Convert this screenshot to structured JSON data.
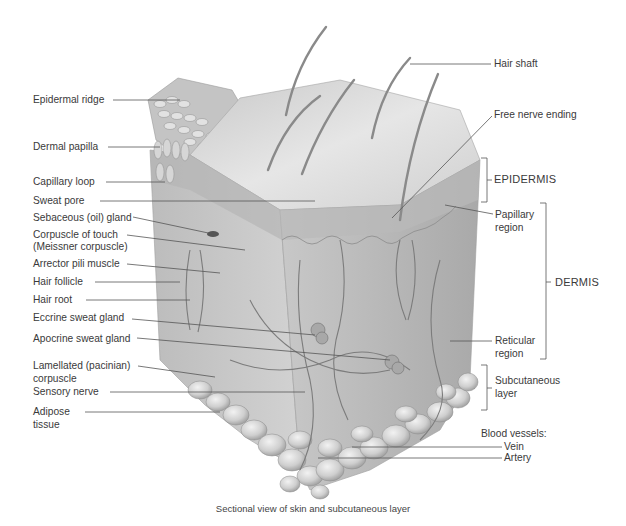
{
  "figure": {
    "caption": "Sectional view of skin and subcutaneous layer",
    "colors": {
      "background": "#ffffff",
      "tissue_light": "#dcdcdc",
      "tissue_mid": "#bdbdbd",
      "tissue_dark": "#8f8f8f",
      "leader_line": "#555555",
      "label_text": "#3a3a3a"
    }
  },
  "labels": {
    "left": [
      {
        "id": "epidermal_ridge",
        "text": "Epidermal ridge"
      },
      {
        "id": "dermal_papilla",
        "text": "Dermal papilla"
      },
      {
        "id": "capillary_loop",
        "text": "Capillary loop"
      },
      {
        "id": "sweat_pore",
        "text": "Sweat pore"
      },
      {
        "id": "sebaceous_gland",
        "text": "Sebaceous (oil) gland"
      },
      {
        "id": "corpuscle_of_touch",
        "text": "Corpuscle of touch",
        "text2": "(Meissner corpuscle)"
      },
      {
        "id": "arrector_pili",
        "text": "Arrector pili muscle"
      },
      {
        "id": "hair_follicle",
        "text": "Hair follicle"
      },
      {
        "id": "hair_root",
        "text": "Hair root"
      },
      {
        "id": "eccrine_gland",
        "text": "Eccrine sweat gland"
      },
      {
        "id": "apocrine_gland",
        "text": "Apocrine sweat gland"
      },
      {
        "id": "lamellated_corpuscle",
        "text": "Lamellated (pacinian)",
        "text2": "corpuscle"
      },
      {
        "id": "sensory_nerve",
        "text": "Sensory nerve"
      },
      {
        "id": "adipose_tissue",
        "text": "Adipose",
        "text2": "tissue"
      }
    ],
    "right": [
      {
        "id": "hair_shaft",
        "text": "Hair shaft"
      },
      {
        "id": "free_nerve_ending",
        "text": "Free nerve ending"
      },
      {
        "id": "papillary_region",
        "text": "Papillary",
        "text2": "region"
      },
      {
        "id": "reticular_region",
        "text": "Reticular",
        "text2": "region"
      },
      {
        "id": "blood_vessels",
        "text": "Blood vessels:"
      },
      {
        "id": "vein",
        "text": "Vein"
      },
      {
        "id": "artery",
        "text": "Artery"
      }
    ],
    "brackets": [
      {
        "id": "epidermis",
        "text": "EPIDERMIS"
      },
      {
        "id": "dermis",
        "text": "DERMIS"
      },
      {
        "id": "subcutaneous",
        "text": "Subcutaneous",
        "text2": "layer"
      }
    ]
  }
}
